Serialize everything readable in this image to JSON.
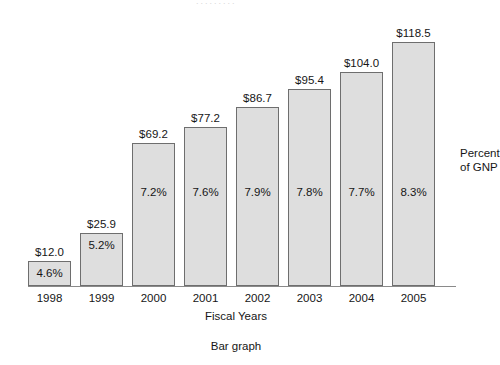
{
  "chart_data": {
    "type": "bar",
    "title": "",
    "caption": "Bar graph",
    "xlabel": "Fiscal Years",
    "ylabel": "",
    "legend": {
      "position": "right",
      "line1": "Percent",
      "line2": "of GNP"
    },
    "grid": false,
    "axis": {
      "baseline_visible": true,
      "y_axis_visible": false,
      "ylim": [
        0,
        130
      ]
    },
    "categories": [
      "1998",
      "1999",
      "2000",
      "2001",
      "2002",
      "2003",
      "2004",
      "2005"
    ],
    "values": [
      12.0,
      25.9,
      69.2,
      77.2,
      86.7,
      95.4,
      104.0,
      118.5
    ],
    "value_labels": [
      "$12.0",
      "$25.9",
      "$69.2",
      "$77.2",
      "$86.7",
      "$95.4",
      "$104.0",
      "$118.5"
    ],
    "series": [
      {
        "name": "Amount",
        "unit": "$ billions",
        "values": [
          12.0,
          25.9,
          69.2,
          77.2,
          86.7,
          95.4,
          104.0,
          118.5
        ]
      },
      {
        "name": "Percent of GNP",
        "unit": "%",
        "values": [
          4.6,
          5.2,
          7.2,
          7.6,
          7.9,
          7.8,
          7.7,
          8.3
        ]
      }
    ],
    "percent_labels": [
      "4.6%",
      "5.2%",
      "7.2%",
      "7.6%",
      "7.9%",
      "7.8%",
      "7.7%",
      "8.3%"
    ],
    "colors": {
      "bar_fill": "#dedede",
      "bar_border": "#6e6e6e",
      "axis": "#8a8a8a",
      "text": "#161616",
      "background": "#ffffff"
    },
    "top_clipped_text": "........."
  }
}
